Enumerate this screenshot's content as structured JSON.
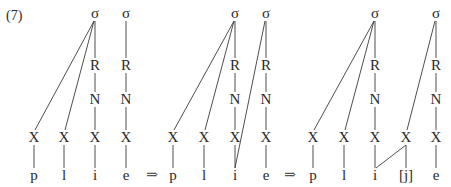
{
  "example_number": "(7)",
  "arrow_symbol": "⇒",
  "tier_labels": {
    "syllable": "σ",
    "rhyme": "R",
    "nucleus": "N",
    "skeletal": "X"
  },
  "stages": [
    {
      "name": "stage-1",
      "segments": [
        "p",
        "l",
        "i",
        "e"
      ],
      "syllables": [
        {
          "onset_slots": [
            0,
            1
          ],
          "nucleus_slot": 2
        },
        {
          "onset_slots": [],
          "nucleus_slot": 3
        }
      ],
      "extra_links": []
    },
    {
      "name": "stage-2",
      "segments": [
        "p",
        "l",
        "i",
        "e"
      ],
      "syllables": [
        {
          "onset_slots": [
            0,
            1
          ],
          "nucleus_slot": 2
        },
        {
          "onset_slots": [],
          "nucleus_slot": 3
        }
      ],
      "extra_links": [
        {
          "type": "sigma-to-segment",
          "from_syllable": 1,
          "to_segment": 2
        }
      ]
    },
    {
      "name": "stage-3",
      "segments": [
        "p",
        "l",
        "i",
        "[j]",
        "e"
      ],
      "syllables": [
        {
          "onset_slots": [
            0,
            1
          ],
          "nucleus_slot": 2
        },
        {
          "onset_slots": [
            3
          ],
          "nucleus_slot": 4
        }
      ],
      "extra_links": [
        {
          "type": "slot-to-segment",
          "from_slot": 3,
          "to_segment": 2
        }
      ]
    }
  ]
}
